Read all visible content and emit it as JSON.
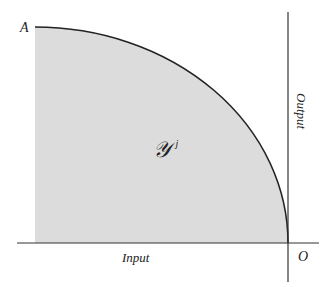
{
  "diagram": {
    "type": "production-possibility-set",
    "labels": {
      "point_a": "A",
      "origin": "O",
      "x_axis": "Input",
      "y_axis": "Output",
      "region": "𝒴",
      "region_superscript": "j"
    },
    "colors": {
      "region_fill": "#dcdcdc",
      "curve": "#222222",
      "axes": "#333333",
      "background": "#ffffff"
    }
  }
}
